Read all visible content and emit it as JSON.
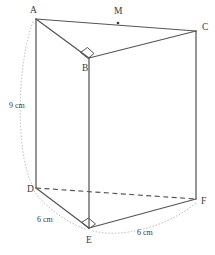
{
  "figure": {
    "shape_name": "triangular-prism",
    "stroke_color": "#555555",
    "hidden_edge_color": "#555555",
    "arc_color": "#b9b4ae",
    "label_color": "#3a3a3a",
    "background": "#ffffff"
  },
  "vertices": [
    {
      "id": "A",
      "label": "A",
      "x": 36,
      "y": 19,
      "label_x": 30,
      "label_y": 13,
      "hidden": false
    },
    {
      "id": "B",
      "label": "B",
      "x": 89,
      "y": 58,
      "label_x": 82,
      "label_y": 71,
      "hidden": false
    },
    {
      "id": "C",
      "label": "C",
      "x": 196,
      "y": 31,
      "label_x": 202,
      "label_y": 30,
      "hidden": false
    },
    {
      "id": "D",
      "label": "D",
      "x": 36,
      "y": 188,
      "label_x": 27,
      "label_y": 192,
      "hidden": false
    },
    {
      "id": "E",
      "label": "E",
      "x": 89,
      "y": 228,
      "label_x": 86,
      "label_y": 243,
      "hidden": false
    },
    {
      "id": "F",
      "label": "F",
      "x": 196,
      "y": 199,
      "label_x": 201,
      "label_y": 204,
      "hidden": false
    }
  ],
  "points": [
    {
      "id": "M",
      "label": "M",
      "x": 118,
      "y": 23,
      "label_x": 114,
      "label_y": 14,
      "on_edge": "A-C",
      "marker": true
    }
  ],
  "edges": [
    {
      "from": "A",
      "to": "C",
      "style": "solid",
      "name": "edge-ac"
    },
    {
      "from": "A",
      "to": "B",
      "style": "solid",
      "name": "edge-ab"
    },
    {
      "from": "B",
      "to": "C",
      "style": "solid",
      "name": "edge-bc"
    },
    {
      "from": "A",
      "to": "D",
      "style": "solid",
      "name": "edge-ad"
    },
    {
      "from": "B",
      "to": "E",
      "style": "solid",
      "name": "edge-be"
    },
    {
      "from": "C",
      "to": "F",
      "style": "solid",
      "name": "edge-cf"
    },
    {
      "from": "D",
      "to": "E",
      "style": "solid",
      "name": "edge-de"
    },
    {
      "from": "E",
      "to": "F",
      "style": "solid",
      "name": "edge-ef"
    },
    {
      "from": "D",
      "to": "F",
      "style": "dashed",
      "name": "edge-df-hidden"
    }
  ],
  "right_angles": [
    {
      "at": "B",
      "name": "right-angle-mark-b",
      "path": "M 80.5 52.5 L 87.5 47.5 L 94 53.5 L 88 58.5 Z"
    },
    {
      "at": "E",
      "name": "right-angle-mark-e",
      "path": "M 81.5 222.5 L 88.5 218 L 95.5 224 L 89 228.5 Z"
    }
  ],
  "dimensions": [
    {
      "id": "height",
      "label": "9 cm",
      "label_x": 9,
      "label_y": 108,
      "measures": "A-D",
      "arc_path": "M 33 22 C 18 60, 14 150, 33 187"
    },
    {
      "id": "base-de",
      "label": "6 cm",
      "label_x": 37,
      "label_y": 222,
      "measures": "D-E",
      "arc_path": "M 34 191 C 44 206, 66 222, 85 229"
    },
    {
      "id": "base-ef",
      "label": "6 cm",
      "label_x": 137,
      "label_y": 235,
      "measures": "E-F",
      "arc_path": "M 93 231 C 124 239, 170 225, 196 203"
    }
  ]
}
